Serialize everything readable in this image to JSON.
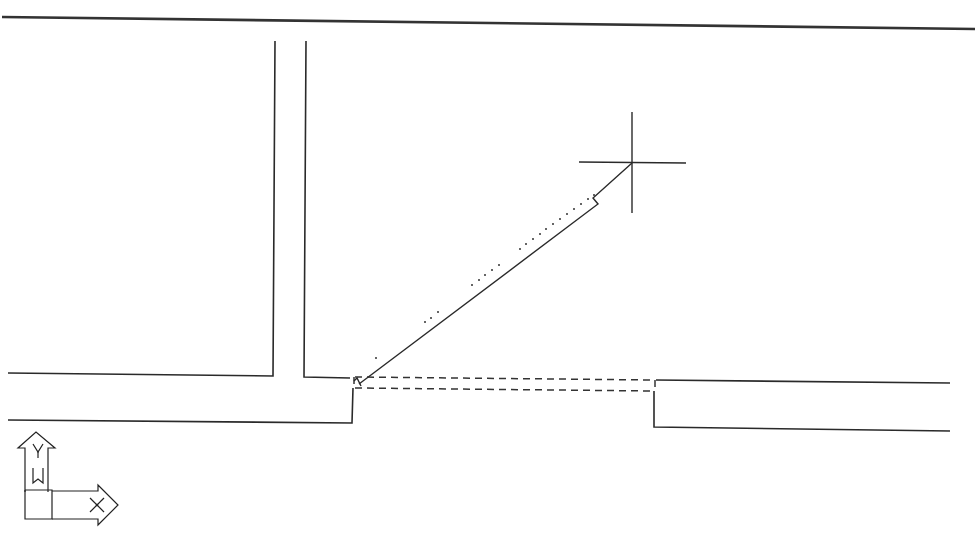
{
  "app": {
    "type": "CAD model space viewport",
    "background": "#ffffff",
    "line_color": "#2a2a2a"
  },
  "drawing": {
    "border_line": {
      "from": [
        2,
        17
      ],
      "to": [
        975,
        29
      ]
    },
    "walls": {
      "vertical_corridor": {
        "left_x": 273,
        "right_x": 306,
        "top_y": 41,
        "bottom_y": 376
      },
      "left_wall_upper": {
        "from": [
          8,
          373
        ],
        "to": [
          270,
          376
        ]
      },
      "left_wall_lower": {
        "from": [
          8,
          420
        ],
        "to": [
          352,
          423
        ]
      },
      "right_wall_upper": {
        "from": [
          656,
          380
        ],
        "to": [
          950,
          383
        ]
      },
      "right_wall_lower": {
        "from": [
          654,
          427
        ],
        "to": [
          950,
          431
        ]
      }
    },
    "opening": {
      "style": "dashed",
      "top_edge": {
        "from": [
          355,
          377
        ],
        "to": [
          655,
          380
        ]
      },
      "bottom_edge": {
        "from": [
          355,
          387
        ],
        "to": [
          655,
          390
        ]
      }
    },
    "rubber_band_line": {
      "from": [
        359,
        384
      ],
      "to": [
        632,
        163
      ]
    },
    "snap_dots_count": 21
  },
  "cursor": {
    "type": "crosshair",
    "position": [
      632,
      163
    ],
    "arm_length": 54
  },
  "ucs_icon": {
    "y_label": "Y",
    "x_label": "X",
    "w_label": "W",
    "position": [
      20,
      432
    ]
  }
}
